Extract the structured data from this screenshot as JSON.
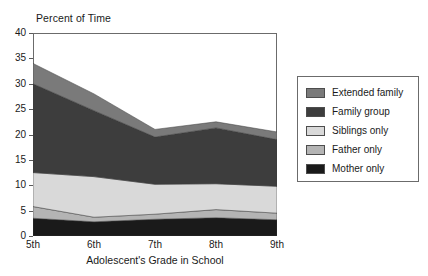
{
  "chart_data": {
    "type": "area",
    "stacked": true,
    "title": "Percent of Time",
    "xlabel": "Adolescent's Grade in School",
    "ylabel": "",
    "categories": [
      "5th",
      "6th",
      "7th",
      "8th",
      "9th"
    ],
    "ylim": [
      0,
      40
    ],
    "ytick_step": 5,
    "yticks": [
      0,
      5,
      10,
      15,
      20,
      25,
      30,
      35,
      40
    ],
    "grid": false,
    "legend_position": "right",
    "series": [
      {
        "name": "Mother only",
        "color": "#1a1a1a",
        "values": [
          3.5,
          2.8,
          3.3,
          3.6,
          3.2
        ]
      },
      {
        "name": "Father only",
        "color": "#b4b4b4",
        "values": [
          2.3,
          0.9,
          1.0,
          1.6,
          1.3
        ]
      },
      {
        "name": "Siblings only",
        "color": "#d9d9d9",
        "values": [
          6.7,
          8.0,
          5.9,
          5.1,
          5.3
        ]
      },
      {
        "name": "Family group",
        "color": "#3d3d3d",
        "values": [
          17.5,
          13.0,
          9.3,
          11.0,
          9.2
        ]
      },
      {
        "name": "Extended family",
        "color": "#7a7a7a",
        "values": [
          4.0,
          3.3,
          1.5,
          1.2,
          1.5
        ]
      }
    ],
    "cumulative_tops": {
      "Mother only": [
        3.5,
        2.8,
        3.3,
        3.6,
        3.2
      ],
      "Father only": [
        5.8,
        3.7,
        4.3,
        5.2,
        4.5
      ],
      "Siblings only": [
        12.5,
        11.7,
        10.2,
        10.3,
        9.8
      ],
      "Family group": [
        30.0,
        24.7,
        19.5,
        21.3,
        19.0
      ],
      "Extended family": [
        34.0,
        28.0,
        21.0,
        22.5,
        20.5
      ]
    }
  },
  "legend": {
    "items": [
      {
        "label": "Extended family"
      },
      {
        "label": "Family group"
      },
      {
        "label": "Siblings only"
      },
      {
        "label": "Father only"
      },
      {
        "label": "Mother only"
      }
    ]
  }
}
